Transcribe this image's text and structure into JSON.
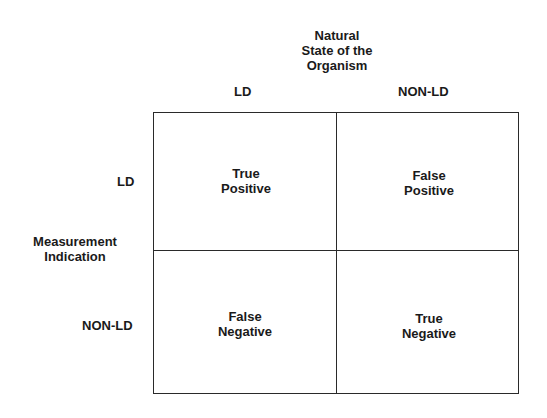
{
  "diagram": {
    "column_header": {
      "title_lines": [
        "Natural",
        "State of the",
        "Organism"
      ],
      "columns": [
        "LD",
        "NON-LD"
      ]
    },
    "row_header": {
      "title_lines": [
        "Measurement",
        "Indication"
      ],
      "rows": [
        "LD",
        "NON-LD"
      ]
    },
    "cells": [
      {
        "row": "LD",
        "col": "LD",
        "lines": [
          "True",
          "Positive"
        ]
      },
      {
        "row": "LD",
        "col": "NON-LD",
        "lines": [
          "False",
          "Positive"
        ]
      },
      {
        "row": "NON-LD",
        "col": "LD",
        "lines": [
          "False",
          "Negative"
        ]
      },
      {
        "row": "NON-LD",
        "col": "NON-LD",
        "lines": [
          "True",
          "Negative"
        ]
      }
    ],
    "colors": {
      "line": "#2a2a2a",
      "text": "#1a1a1a",
      "background": "#ffffff"
    }
  }
}
